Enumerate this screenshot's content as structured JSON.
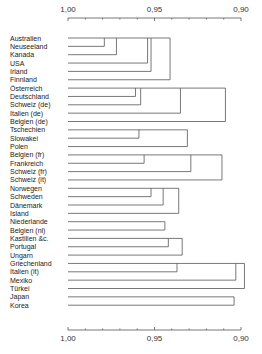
{
  "chart_data": {
    "type": "dendrogram",
    "title": "",
    "axis": {
      "ticks": [
        "1,00",
        "0,95",
        "0,90"
      ],
      "tick_values": [
        1.0,
        0.95,
        0.9
      ],
      "range": [
        1.0,
        0.9
      ],
      "position": "top and bottom"
    },
    "leaves": [
      "Australien",
      "Neuseeland",
      "Kanada",
      "USA",
      "Irland",
      "Finnland",
      "Österreich",
      "Deutschland",
      "Schweiz (de)",
      "Italien (de)",
      "Belgien (de)",
      "Tschechien",
      "Slowakei",
      "Polen",
      "Belgien (fr)",
      "Frankreich",
      "Schweiz (fr)",
      "Schweiz (it)",
      "Norwegen",
      "Schweden",
      "Dänemark",
      "Island",
      "Niederlande",
      "Belgien (nl)",
      "Kastilien &c.",
      "Portugal",
      "Ungarn",
      "Griechenland",
      "Italien (it)",
      "Mexiko",
      "Türkei",
      "Japan",
      "Korea"
    ],
    "merges": [
      {
        "rows": [
          0,
          1
        ],
        "height": 0.979
      },
      {
        "rows": [
          0,
          2
        ],
        "height": 0.972
      },
      {
        "rows": [
          0,
          3
        ],
        "height": 0.954
      },
      {
        "rows": [
          0,
          4
        ],
        "height": 0.952
      },
      {
        "rows": [
          0,
          5
        ],
        "height": 0.941
      },
      {
        "rows": [
          6,
          7
        ],
        "height": 0.961
      },
      {
        "rows": [
          6,
          8
        ],
        "height": 0.958
      },
      {
        "rows": [
          6,
          9
        ],
        "height": 0.935
      },
      {
        "rows": [
          6,
          10
        ],
        "height": 0.909
      },
      {
        "rows": [
          11,
          12
        ],
        "height": 0.959
      },
      {
        "rows": [
          11,
          13
        ],
        "height": 0.931
      },
      {
        "rows": [
          14,
          15
        ],
        "height": 0.956
      },
      {
        "rows": [
          14,
          16
        ],
        "height": 0.929
      },
      {
        "rows": [
          14,
          17
        ],
        "height": 0.911
      },
      {
        "rows": [
          18,
          19
        ],
        "height": 0.952
      },
      {
        "rows": [
          18,
          20
        ],
        "height": 0.945
      },
      {
        "rows": [
          18,
          21
        ],
        "height": 0.936
      },
      {
        "rows": [
          22,
          23
        ],
        "height": 0.944
      },
      {
        "rows": [
          24,
          25
        ],
        "height": 0.942
      },
      {
        "rows": [
          24,
          26
        ],
        "height": 0.934
      },
      {
        "rows": [
          27,
          28
        ],
        "height": 0.937
      },
      {
        "rows": [
          27,
          29
        ],
        "height": 0.903
      },
      {
        "rows": [
          27,
          30
        ],
        "height": 0.898
      },
      {
        "rows": [
          31,
          32
        ],
        "height": 0.904
      }
    ]
  }
}
